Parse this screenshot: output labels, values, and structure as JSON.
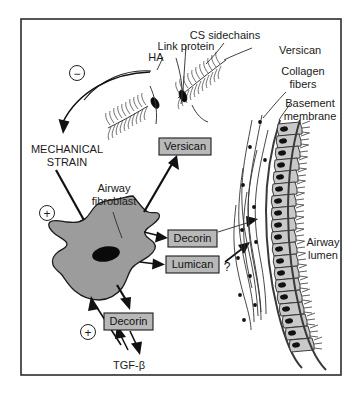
{
  "figure": {
    "border_color": "#2c2c2c",
    "background": "#ffffff"
  },
  "labels": {
    "cs_sidechains": "CS sidechains",
    "link_protein": "Link protein",
    "ha": "HA",
    "versican_callout": "Versican",
    "collagen_fibers_line1": "Collagen",
    "collagen_fibers_line2": "fibers",
    "basement_membrane_line1": "Basement",
    "basement_membrane_line2": "membrane",
    "mechanical_strain_line1": "MECHANICAL",
    "mechanical_strain_line2": "STRAIN",
    "airway_fibroblast_line1": "Airway",
    "airway_fibroblast_line2": "fibroblast",
    "airway_lumen_line1": "Airway",
    "airway_lumen_line2": "lumen",
    "tgf_beta": "TGF-β",
    "question_mark": "?"
  },
  "boxes": [
    {
      "id": "versican-box",
      "text": "Versican",
      "x": 159,
      "y": 138,
      "w": 52,
      "h": 17
    },
    {
      "id": "decorin-box-upper",
      "text": "Decorin",
      "x": 168,
      "y": 230,
      "w": 49,
      "h": 17
    },
    {
      "id": "lumican-box",
      "text": "Lumican",
      "x": 166,
      "y": 256,
      "w": 53,
      "h": 17
    },
    {
      "id": "decorin-box-lower",
      "text": "Decorin",
      "x": 104,
      "y": 313,
      "w": 49,
      "h": 17
    }
  ],
  "signs": [
    {
      "id": "minus-sign-strain",
      "symbol": "−",
      "cx": 77,
      "cy": 73,
      "r": 7.5
    },
    {
      "id": "plus-sign-strain-fibroblast",
      "symbol": "+",
      "cx": 47,
      "cy": 213,
      "r": 7.5
    },
    {
      "id": "plus-sign-tgfb-fibroblast",
      "symbol": "+",
      "cx": 88,
      "cy": 332,
      "r": 7.5
    }
  ],
  "colors": {
    "cell_fill": "#9c9c9c",
    "nucleus": "#0a0a0a",
    "epithelium_fill": "#c9c9c9",
    "box_fill": "#b8b8b8",
    "line": "#1a1a1a",
    "frame": "#2c2c2c"
  },
  "structures": {
    "fibroblast": "irregular stellate gray cell with black elliptical nucleus",
    "proteoglycan_aggregates": 2,
    "epithelial_cells": 22,
    "collagen_fiber_strands": 6
  }
}
